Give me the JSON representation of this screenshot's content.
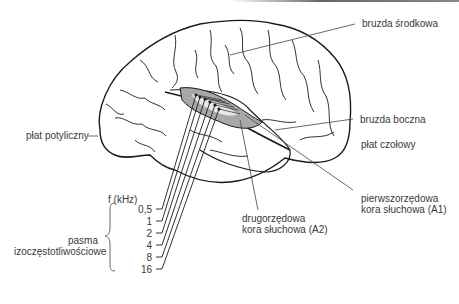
{
  "diagram": {
    "type": "anatomical-illustration",
    "labels": {
      "central_sulcus": "bruzda środkowa",
      "lateral_sulcus": "bruzda boczna",
      "frontal_lobe": "płat czołowy",
      "occipital_lobe": "płat potyliczny",
      "primary_auditory_1": "pierwszorzędowa",
      "primary_auditory_2": "kora słuchowa (A1)",
      "secondary_auditory_1": "drugorzędowa",
      "secondary_auditory_2": "kora słuchowa (A2)",
      "freq_axis": "f (kHz)",
      "bands_1": "pasma",
      "bands_2": "izoczęstotliwościowe"
    },
    "frequencies": [
      "0,5",
      "1",
      "2",
      "4",
      "8",
      "16"
    ],
    "colors": {
      "outline": "#1a1a1a",
      "auditory_cortex_fill": "#a8a8a8",
      "text": "#3a3a3a"
    }
  }
}
